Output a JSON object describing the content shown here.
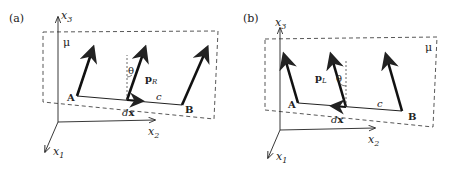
{
  "panels": [
    {
      "id": "a",
      "label": "(a)",
      "plane_label": "μ",
      "axes": {
        "x1": "x",
        "x1_sub": "1",
        "x2": "x",
        "x2_sub": "2",
        "x3": "x",
        "x3_sub": "3"
      },
      "points": {
        "A": "A",
        "B": "B"
      },
      "segment_label": "c",
      "element_label": "dx",
      "element_label_d": "d",
      "element_label_x": "x",
      "vector_label": "p",
      "vector_sub": "R",
      "angle_label": "θ"
    },
    {
      "id": "b",
      "label": "(b)",
      "plane_label": "μ",
      "axes": {
        "x1": "x",
        "x1_sub": "1",
        "x2": "x",
        "x2_sub": "2",
        "x3": "x",
        "x3_sub": "3"
      },
      "points": {
        "A": "A",
        "B": "B"
      },
      "segment_label": "c",
      "element_label": "dx",
      "element_label_d": "d",
      "element_label_x": "x",
      "vector_label": "p",
      "vector_sub": "L",
      "angle_label": "θ"
    }
  ],
  "colors": {
    "line": "#222222",
    "dashed": "#444444",
    "background": "#ffffff"
  }
}
